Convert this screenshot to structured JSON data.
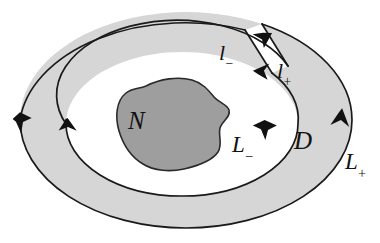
{
  "figure": {
    "type": "math-diagram",
    "canvas": {
      "width": 380,
      "height": 243
    },
    "background_color": "#ffffff",
    "colors": {
      "annulus_fill": "#d6d6d6",
      "inner_hole_fill": "#ffffff",
      "blob_fill": "#9e9e9e",
      "stroke": "#1a1a1a",
      "label_color": "#111111"
    },
    "labels": {
      "blob": "N",
      "domain": "D",
      "inner_boundary": "L",
      "inner_boundary_sub": "−",
      "outer_boundary": "L",
      "outer_boundary_sub": "+",
      "cut_left": "l",
      "cut_left_sub": "−",
      "cut_right": "l",
      "cut_right_sub": "+"
    },
    "regions": [
      {
        "name": "annulus",
        "label": "D",
        "fill": "#d6d6d6",
        "description": "shaded ring-shaped domain"
      },
      {
        "name": "hole",
        "label": "",
        "fill": "#ffffff",
        "description": "white interior hole"
      },
      {
        "name": "blob",
        "label": "N",
        "fill": "#9e9e9e",
        "description": "dark irregular inner set"
      }
    ],
    "boundaries": [
      {
        "name": "outer",
        "label": "L+",
        "orientation": "counterclockwise",
        "arrows": [
          "up-right",
          "down-left"
        ]
      },
      {
        "name": "inner",
        "label": "L-",
        "orientation": "clockwise",
        "arrows": [
          "down-right",
          "up-left"
        ]
      },
      {
        "name": "cut-left-edge",
        "label": "l-",
        "arrow": "up-outward"
      },
      {
        "name": "cut-right-edge",
        "label": "l+",
        "arrow": "down-inward"
      }
    ]
  }
}
